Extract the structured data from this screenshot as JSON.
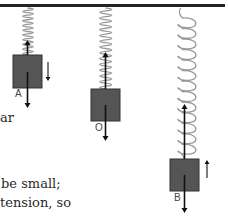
{
  "diagram": {
    "colors": {
      "ceiling": "#222222",
      "spring": "#9a9a9a",
      "block_fill": "#555555",
      "block_stroke": "#333333",
      "arrow": "#111111",
      "background": "#ffffff"
    },
    "ceiling": {
      "x1": 0,
      "x2": 225,
      "y": 5.5,
      "thickness": 3
    },
    "masses": [
      {
        "label": "A",
        "block": {
          "x": 13,
          "y": 55,
          "w": 29,
          "h": 33
        },
        "spring": {
          "x_left": 20,
          "x_right": 37,
          "y_top": 8,
          "y_bottom": 55,
          "coils": 10,
          "style": "compressed"
        },
        "tension_arrow": {
          "from_y": 55,
          "to_y": 40
        },
        "weight_arrow": {
          "from_y": 72,
          "to_y": 108
        },
        "motion_arrow": {
          "direction": "down",
          "x": 48,
          "y1": 62,
          "y2": 81
        },
        "label_pos": {
          "x": 15,
          "y": 89
        }
      },
      {
        "label": "O",
        "block": {
          "x": 91,
          "y": 89,
          "w": 29,
          "h": 32
        },
        "spring": {
          "x_left": 96,
          "x_right": 116,
          "y_top": 8,
          "y_bottom": 89,
          "coils": 14,
          "style": "equilibrium"
        },
        "tension_arrow": {
          "from_y": 89,
          "to_y": 52
        },
        "weight_arrow": {
          "from_y": 105,
          "to_y": 141
        },
        "motion_arrow": null,
        "label_pos": {
          "x": 95,
          "y": 123
        }
      },
      {
        "label": "B",
        "block": {
          "x": 170,
          "y": 159,
          "w": 29,
          "h": 32
        },
        "spring": {
          "x_left": 177,
          "x_right": 198,
          "y_top": 8,
          "y_bottom": 159,
          "coils": 13,
          "style": "stretched"
        },
        "tension_arrow": {
          "from_y": 159,
          "to_y": 104
        },
        "weight_arrow": {
          "from_y": 175,
          "to_y": 213
        },
        "motion_arrow": {
          "direction": "up",
          "x": 207,
          "y1": 178,
          "y2": 160
        },
        "label_pos": {
          "x": 174,
          "y": 193
        }
      }
    ]
  },
  "text_fragments": [
    {
      "id": "frag-ar",
      "text": "ar",
      "x": 0,
      "y": 111
    },
    {
      "id": "frag-be-small",
      "text": "be small;",
      "x": 1,
      "y": 177
    },
    {
      "id": "frag-tension-so",
      "text": "tension, so",
      "x": 0,
      "y": 196
    }
  ]
}
